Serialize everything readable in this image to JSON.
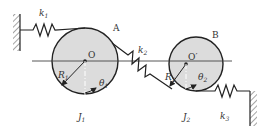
{
  "diagram": {
    "disks": [
      {
        "id": "A",
        "label": "A",
        "center_label": "O",
        "radius_label": "R",
        "radius_sub": "1",
        "angle_label": "θ",
        "angle_sub": "1",
        "inertia_label": "J",
        "inertia_sub": "1"
      },
      {
        "id": "B",
        "label": "B",
        "center_label": "O′",
        "radius_label": "R",
        "radius_sub": "2",
        "angle_label": "θ",
        "angle_sub": "2",
        "inertia_label": "J",
        "inertia_sub": "2"
      }
    ],
    "springs": [
      {
        "label": "k",
        "sub": "1"
      },
      {
        "label": "k",
        "sub": "2"
      },
      {
        "label": "k",
        "sub": "3"
      }
    ],
    "colors": {
      "disk_fill": "#dcdcdc",
      "stroke": "#222222",
      "hatch": "#555555"
    }
  }
}
